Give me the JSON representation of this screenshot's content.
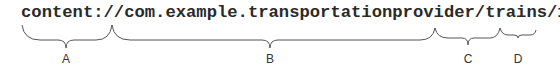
{
  "uri": "content://com.example.transportationprovider/trains/122",
  "segments": [
    {
      "label": "A",
      "text": "content://",
      "x1": 22,
      "x2": 112,
      "tip": 66
    },
    {
      "label": "B",
      "text": "com.example.transportationprovider",
      "x1": 112,
      "x2": 435,
      "tip": 270
    },
    {
      "label": "C",
      "text": "/trains",
      "x1": 435,
      "x2": 500,
      "tip": 468
    },
    {
      "label": "D",
      "text": "/122",
      "x1": 500,
      "x2": 536,
      "tip": 518
    }
  ],
  "colors": {
    "text": "#2a2a2a",
    "brace": "#555555"
  }
}
